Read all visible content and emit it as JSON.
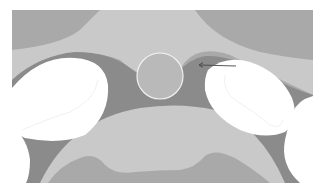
{
  "diagram": {
    "canvas": {
      "width": 322,
      "height": 189,
      "background": "#ffffff"
    },
    "frame": {
      "x": 12,
      "y": 10,
      "width": 301,
      "height": 173
    },
    "colors": {
      "mid_gray": "#a9a9a9",
      "light_gray": "#c9c9c9",
      "dark_gray": "#8b8b8b",
      "circle_fill": "#b9b9b9",
      "circle_stroke": "#f2f2f2",
      "white": "#ffffff",
      "faint_outline": "#ececec",
      "arrow": "#444444"
    },
    "shapes": {
      "top_light_band": "M100,10 L195,10 Q215,40 260,52 Q290,58 313,60 L313,95 Q260,70 230,55 Q200,45 185,62 Q175,78 160,78 Q140,78 120,60 Q95,50 60,55 Q30,62 12,80 L12,50 Q60,45 80,30 Q95,15 100,10 Z",
      "dark_region": "M12,80 Q40,55 75,52 Q110,52 130,68 Q150,85 175,75 Q190,58 205,56 Q230,55 260,72 Q290,88 313,95 L313,183 L12,183 Z",
      "bottom_light_dome": "M40,183 Q70,120 140,108 Q180,102 215,110 Q260,125 285,183 Z",
      "bottom_inner_mid": "M48,183 Q60,165 80,158 Q95,152 105,165 Q115,175 135,172 Q160,170 180,170 Q195,168 205,156 Q215,148 235,158 Q255,170 270,183 Z",
      "left_white_blob": "M12,88 Q40,55 75,58 Q105,60 108,85 Q110,115 85,135 Q60,145 25,138 Q12,133 12,125 Z",
      "left_corner_white": "M12,125 Q28,140 30,160 Q30,175 26,183 L12,183 Z",
      "right_white_blob": "M208,70 Q225,55 250,62 Q280,72 292,98 Q300,120 285,132 Q265,140 240,130 Q210,115 205,90 Q204,78 208,70 Z",
      "right_corner_white": "M313,96 Q298,100 293,112 Q288,125 285,140 Q280,165 300,183 L313,183 Z",
      "left_blob_outline": "M22,130 Q50,118 70,112 Q95,100 98,80",
      "right_blob_outline": "M225,75 Q222,90 235,100 Q255,112 270,125 Q280,130 283,120"
    },
    "circle": {
      "cx": 160,
      "cy": 76,
      "r": 23
    },
    "arrow": {
      "x1": 236,
      "y1": 66,
      "x2": 199,
      "y2": 65,
      "head_size": 4
    }
  }
}
